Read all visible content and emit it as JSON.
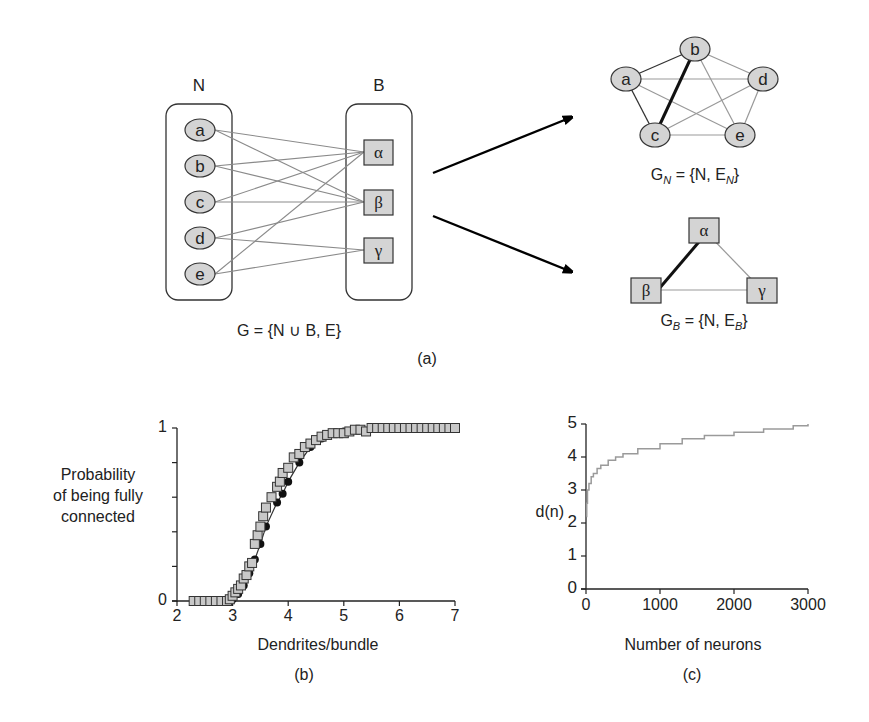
{
  "panel_a": {
    "label": "(a)",
    "bipartite": {
      "set_n_label": "N",
      "set_b_label": "B",
      "n_nodes": [
        "a",
        "b",
        "c",
        "d",
        "e"
      ],
      "b_nodes": [
        "α",
        "β",
        "γ"
      ],
      "edges": [
        [
          "a",
          "α"
        ],
        [
          "a",
          "β"
        ],
        [
          "b",
          "α"
        ],
        [
          "b",
          "β"
        ],
        [
          "c",
          "α"
        ],
        [
          "c",
          "β"
        ],
        [
          "d",
          "β"
        ],
        [
          "d",
          "γ"
        ],
        [
          "e",
          "α"
        ],
        [
          "e",
          "γ"
        ]
      ],
      "caption": "G = {N ∪ B, E}"
    },
    "projection_n": {
      "nodes": [
        "a",
        "b",
        "c",
        "d",
        "e"
      ],
      "edges_dark": [
        [
          "a",
          "b"
        ],
        [
          "a",
          "c"
        ]
      ],
      "edges_thick": [
        [
          "b",
          "c"
        ]
      ],
      "edges_gray": [
        [
          "a",
          "d"
        ],
        [
          "a",
          "e"
        ],
        [
          "b",
          "d"
        ],
        [
          "b",
          "e"
        ],
        [
          "c",
          "d"
        ],
        [
          "c",
          "e"
        ],
        [
          "d",
          "e"
        ]
      ],
      "caption_main": "G",
      "caption_sub": "N",
      "caption_rest": " = {N, E",
      "caption_sub2": "N",
      "caption_end": "}"
    },
    "projection_b": {
      "nodes": [
        "α",
        "β",
        "γ"
      ],
      "edges_thick": [
        [
          "α",
          "β"
        ]
      ],
      "edges_gray": [
        [
          "α",
          "γ"
        ],
        [
          "β",
          "γ"
        ]
      ],
      "caption_main": "G",
      "caption_sub": "B",
      "caption_rest": " = {N, E",
      "caption_sub2": "B",
      "caption_end": "}"
    }
  },
  "chart_data": [
    {
      "panel": "(b)",
      "type": "scatter",
      "title": "",
      "xlabel": "Dendrites/bundle",
      "ylabel": "Probability of being fully connected",
      "ylabel_lines": [
        "Probability",
        "of being fully",
        "connected"
      ],
      "xlim": [
        2,
        7
      ],
      "ylim": [
        0,
        1
      ],
      "xticks": [
        "2",
        "3",
        "4",
        "5",
        "6",
        "7"
      ],
      "yticks": [
        "0",
        "1"
      ],
      "y_minor_ticks": [
        0.2,
        0.4,
        0.6,
        0.8
      ],
      "grid": false,
      "series": [
        {
          "name": "simulation (squares)",
          "marker": "square",
          "x": [
            2.3,
            2.4,
            2.5,
            2.6,
            2.7,
            2.8,
            2.9,
            2.95,
            3.0,
            3.05,
            3.1,
            3.15,
            3.2,
            3.25,
            3.3,
            3.35,
            3.4,
            3.45,
            3.5,
            3.55,
            3.6,
            3.7,
            3.8,
            3.85,
            3.9,
            4.0,
            4.1,
            4.2,
            4.3,
            4.4,
            4.5,
            4.6,
            4.7,
            4.8,
            4.9,
            5.0,
            5.1,
            5.2,
            5.3,
            5.4,
            5.5,
            5.6,
            5.7,
            5.8,
            5.9,
            6.0,
            6.1,
            6.2,
            6.3,
            6.4,
            6.5,
            6.6,
            6.7,
            6.8,
            6.9,
            7.0
          ],
          "y": [
            0,
            0,
            0,
            0,
            0,
            0,
            0,
            0.01,
            0.03,
            0.05,
            0.07,
            0.09,
            0.13,
            0.15,
            0.2,
            0.22,
            0.33,
            0.38,
            0.43,
            0.49,
            0.54,
            0.6,
            0.66,
            0.69,
            0.74,
            0.77,
            0.83,
            0.85,
            0.89,
            0.91,
            0.93,
            0.95,
            0.96,
            0.97,
            0.97,
            0.97,
            0.98,
            0.99,
            0.99,
            0.98,
            1.0,
            1.0,
            1.0,
            1.0,
            1.0,
            1.0,
            1.0,
            1.0,
            1.0,
            1.0,
            1.0,
            1.0,
            1.0,
            1.0,
            1.0,
            1.0
          ]
        },
        {
          "name": "theory (filled circles)",
          "marker": "circle",
          "x": [
            3.0,
            3.1,
            3.2,
            3.3,
            3.4,
            3.5,
            3.6,
            3.8,
            3.9,
            4.0,
            4.2,
            4.4,
            4.6,
            5.0,
            5.5,
            6.0
          ],
          "y": [
            0.01,
            0.04,
            0.09,
            0.16,
            0.24,
            0.33,
            0.43,
            0.57,
            0.62,
            0.69,
            0.8,
            0.89,
            0.94,
            0.98,
            1.0,
            1.0
          ]
        }
      ]
    },
    {
      "panel": "(c)",
      "type": "line",
      "title": "",
      "xlabel": "Number of neurons",
      "ylabel": "d(n)",
      "xlim": [
        0,
        3000
      ],
      "ylim": [
        0,
        5
      ],
      "xticks": [
        "0",
        "1000",
        "2000",
        "3000"
      ],
      "yticks": [
        "0",
        "1",
        "2",
        "3",
        "4",
        "5"
      ],
      "grid": false,
      "series": [
        {
          "name": "d(n)",
          "x": [
            5,
            10,
            20,
            40,
            70,
            100,
            150,
            200,
            300,
            400,
            500,
            700,
            1000,
            1300,
            1600,
            2000,
            2400,
            2800,
            3000
          ],
          "y": [
            2.2,
            2.6,
            3.0,
            3.2,
            3.4,
            3.5,
            3.65,
            3.75,
            3.9,
            4.0,
            4.1,
            4.25,
            4.4,
            4.55,
            4.65,
            4.75,
            4.85,
            4.95,
            5.0
          ]
        }
      ]
    }
  ],
  "colors": {
    "node_fill": "#d4d4d4",
    "edge_gray": "#8a8a8a",
    "edge_dark": "#333333",
    "edge_thick": "#111111",
    "curve_c": "#9a9a9a",
    "text": "#222222"
  }
}
